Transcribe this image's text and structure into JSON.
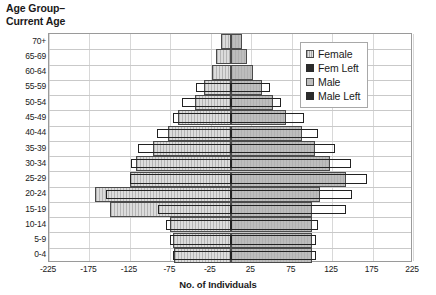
{
  "chart_data": {
    "type": "bar",
    "title": "",
    "ylabel": "Age Group–\nCurrent Age",
    "xlabel": "No. of Individuals",
    "orientation": "horizontal",
    "style": "population-pyramid",
    "grid": true,
    "xlim": [
      -225,
      225
    ],
    "xticks": [
      -225,
      -175,
      -125,
      -75,
      -25,
      25,
      75,
      125,
      175,
      225
    ],
    "xtick_labels": [
      "-225",
      "-175",
      "-125",
      "-75",
      "-25",
      "25",
      "75",
      "125",
      "175",
      "225"
    ],
    "categories": [
      "70+",
      "65-69",
      "60-64",
      "55-59",
      "50-54",
      "45-49",
      "40-44",
      "35-39",
      "30-34",
      "25-29",
      "20-24",
      "15-19",
      "10-14",
      "5-9",
      "0-4"
    ],
    "legend_position": "top-right",
    "legend": [
      "Female",
      "Fem Left",
      "Male",
      "Male Left"
    ],
    "series": [
      {
        "name": "Female",
        "side": "left",
        "note": "plotted as negative values on the left half",
        "values": [
          -12,
          -18,
          -24,
          -33,
          -44,
          -66,
          -78,
          -97,
          -118,
          -125,
          -168,
          -150,
          -75,
          -72,
          -70
        ]
      },
      {
        "name": "Fem Left",
        "side": "left",
        "note": "dark outlined overlay bars on the left half",
        "values": [
          0,
          0,
          0,
          -43,
          -60,
          -72,
          -91,
          -115,
          -124,
          -125,
          -154,
          -90,
          -80,
          -76,
          -72
        ]
      },
      {
        "name": "Male",
        "side": "right",
        "values": [
          14,
          20,
          27,
          38,
          52,
          68,
          88,
          104,
          122,
          142,
          110,
          100,
          100,
          100,
          100
        ]
      },
      {
        "name": "Male Left",
        "side": "right",
        "note": "dark outlined overlay bars on the right half",
        "values": [
          0,
          0,
          0,
          48,
          62,
          90,
          108,
          128,
          148,
          168,
          150,
          142,
          108,
          105,
          105
        ]
      }
    ]
  },
  "axes": {
    "y_title": "Age Group–\nCurrent Age",
    "x_title": "No. of Individuals"
  },
  "legend": {
    "items": [
      {
        "label": "Female",
        "key": "female"
      },
      {
        "label": "Fem Left",
        "key": "femleft"
      },
      {
        "label": "Male",
        "key": "male"
      },
      {
        "label": "Male Left",
        "key": "maleleft"
      }
    ]
  }
}
